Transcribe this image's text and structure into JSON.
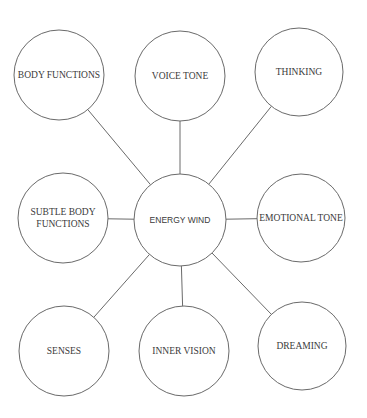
{
  "diagram": {
    "type": "hub-and-spoke",
    "center": {
      "id": "energy_wind",
      "label": "ENERGY WIND",
      "cx": 180,
      "cy": 220,
      "r": 46
    },
    "nodes": [
      {
        "id": "body_functions",
        "lines": [
          "BODY FUNCTIONS"
        ],
        "cx": 59,
        "cy": 75,
        "r": 45
      },
      {
        "id": "voice_tone",
        "lines": [
          "VOICE TONE"
        ],
        "cx": 180,
        "cy": 76,
        "r": 45
      },
      {
        "id": "thinking",
        "lines": [
          "THINKING"
        ],
        "cx": 299,
        "cy": 72,
        "r": 44
      },
      {
        "id": "subtle_body_functions",
        "lines": [
          "SUBTLE BODY",
          "FUNCTIONS"
        ],
        "cx": 63,
        "cy": 218,
        "r": 45
      },
      {
        "id": "emotional_tone",
        "lines": [
          "EMOTIONAL TONE"
        ],
        "cx": 301,
        "cy": 218,
        "r": 44
      },
      {
        "id": "senses",
        "lines": [
          "SENSES"
        ],
        "cx": 64,
        "cy": 351,
        "r": 45
      },
      {
        "id": "inner_vision",
        "lines": [
          "INNER VISION"
        ],
        "cx": 184,
        "cy": 351,
        "r": 45
      },
      {
        "id": "dreaming",
        "lines": [
          "DREAMING"
        ],
        "cx": 302,
        "cy": 346,
        "r": 44
      }
    ],
    "edges": [
      [
        "energy_wind",
        "body_functions"
      ],
      [
        "energy_wind",
        "voice_tone"
      ],
      [
        "energy_wind",
        "thinking"
      ],
      [
        "energy_wind",
        "subtle_body_functions"
      ],
      [
        "energy_wind",
        "emotional_tone"
      ],
      [
        "energy_wind",
        "senses"
      ],
      [
        "energy_wind",
        "inner_vision"
      ],
      [
        "energy_wind",
        "dreaming"
      ]
    ],
    "colors": {
      "stroke": "#6a6a6a",
      "text": "#3a3a3a",
      "background": "#ffffff"
    }
  }
}
